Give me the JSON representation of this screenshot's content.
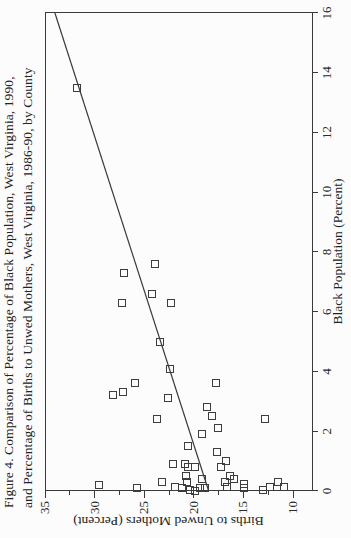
{
  "figure": {
    "title_line1": "Figure 4. Comparison of Percentage of Black Population, West Virginia, 1990,",
    "title_line2": "and Percentage of Births to Unwed Mothers, West Virginia, 1986-90, by County"
  },
  "chart_data": {
    "type": "scatter",
    "title": "Figure 4. Comparison of Percentage of Black Population, West Virginia, 1990, and Percentage of Births to Unwed Mothers, West Virginia, 1986-90, by County",
    "xlabel": "Black Population (Percent)",
    "ylabel": "Births to Unwed Mothers (Percent)",
    "xlim": [
      0,
      16
    ],
    "ylim": [
      10,
      35
    ],
    "x_ticks": [
      0,
      2,
      4,
      6,
      8,
      10,
      12,
      14,
      16
    ],
    "y_ticks": [
      35,
      30,
      25,
      20,
      15,
      10
    ],
    "y_minor_ticks": [
      32.5,
      27.5,
      22.5,
      17.5,
      12.5
    ],
    "grid": false,
    "legend": "none",
    "marker": "open-square",
    "orientation_note": "figure rotated 90 degrees counter-clockwise on page",
    "points_black_pct_vs_unwed_pct": [
      [
        13.5,
        31.8
      ],
      [
        7.6,
        23.9
      ],
      [
        7.3,
        27.0
      ],
      [
        6.6,
        24.2
      ],
      [
        6.3,
        27.2
      ],
      [
        6.3,
        22.3
      ],
      [
        5.0,
        23.4
      ],
      [
        4.1,
        22.4
      ],
      [
        3.6,
        25.9
      ],
      [
        3.6,
        17.8
      ],
      [
        3.3,
        27.1
      ],
      [
        3.2,
        28.1
      ],
      [
        3.1,
        22.6
      ],
      [
        2.8,
        18.7
      ],
      [
        2.5,
        18.2
      ],
      [
        2.4,
        23.7
      ],
      [
        2.4,
        12.8
      ],
      [
        2.1,
        17.6
      ],
      [
        1.9,
        19.2
      ],
      [
        1.5,
        20.6
      ],
      [
        1.3,
        17.7
      ],
      [
        1.0,
        16.8
      ],
      [
        0.9,
        22.1
      ],
      [
        0.9,
        20.9
      ],
      [
        0.8,
        20.6
      ],
      [
        0.8,
        19.9
      ],
      [
        0.8,
        17.3
      ],
      [
        0.5,
        20.8
      ],
      [
        0.3,
        20.7
      ],
      [
        0.5,
        16.4
      ],
      [
        0.4,
        15.9
      ],
      [
        0.3,
        23.2
      ],
      [
        0.4,
        19.2
      ],
      [
        0.3,
        16.9
      ],
      [
        0.15,
        16.7
      ],
      [
        0.2,
        29.6
      ],
      [
        0.1,
        25.7
      ],
      [
        0.15,
        21.9
      ],
      [
        0.1,
        21.2
      ],
      [
        0.05,
        20.4
      ],
      [
        0.0,
        19.9
      ],
      [
        0.1,
        19.4
      ],
      [
        0.1,
        18.9
      ],
      [
        0.25,
        14.9
      ],
      [
        0.1,
        14.9
      ],
      [
        0.05,
        13.0
      ],
      [
        0.15,
        12.3
      ],
      [
        0.3,
        11.5
      ],
      [
        0.15,
        10.9
      ]
    ],
    "regression_line": {
      "black_pct": [
        16,
        0.0
      ],
      "unwed_pct": [
        34.0,
        18.5
      ]
    },
    "ink_color": "#3a3a3a",
    "background_color": "#fcfcfc"
  }
}
